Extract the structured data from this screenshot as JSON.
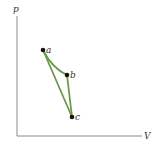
{
  "diagram": {
    "type": "pV-diagram",
    "axes": {
      "y_label": "p",
      "x_label": "V",
      "color": "#8a8a8a"
    },
    "points": [
      {
        "id": "a",
        "label": "a",
        "x": 43,
        "y": 50
      },
      {
        "id": "b",
        "label": "b",
        "x": 67,
        "y": 75
      },
      {
        "id": "c",
        "label": "c",
        "x": 72,
        "y": 117
      }
    ],
    "paths": [
      {
        "from": "a",
        "to": "b",
        "shape": "curve"
      },
      {
        "from": "b",
        "to": "c",
        "shape": "straight"
      },
      {
        "from": "c",
        "to": "a",
        "shape": "straight"
      }
    ],
    "path_color": "#6a9a4a",
    "point_color": "#111111"
  }
}
